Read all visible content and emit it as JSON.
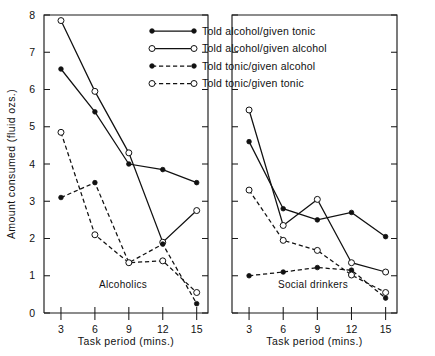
{
  "figure": {
    "width": 435,
    "height": 356,
    "background": "#ffffff",
    "ink_color": "#111111"
  },
  "chart_data": {
    "type": "line",
    "title": "",
    "xlabel": "Task period (mins.)",
    "ylabel": "Amount consumed (fluid ozs.)",
    "x": [
      3,
      6,
      9,
      12,
      15
    ],
    "xlim": [
      1.5,
      16.0
    ],
    "ylim": [
      0,
      8
    ],
    "xticks": [
      "3",
      "6",
      "9",
      "12",
      "15"
    ],
    "yticks": [
      "0",
      "1",
      "2",
      "3",
      "4",
      "5",
      "6",
      "7",
      "8"
    ],
    "grid": false,
    "legend_position": "top-center",
    "panels": [
      {
        "name": "Alcoholics",
        "label": "Alcoholics",
        "series": [
          {
            "name": "Told alcohol/given tonic",
            "marker": "filled-circle",
            "line": "solid",
            "values": [
              6.55,
              5.4,
              4.0,
              3.85,
              3.5
            ]
          },
          {
            "name": "Told alcohol/given alcohol",
            "marker": "open-circle",
            "line": "solid",
            "values": [
              7.85,
              5.95,
              4.3,
              1.9,
              2.75
            ]
          },
          {
            "name": "Told tonic/given alcohol",
            "marker": "filled-circle",
            "line": "dashed",
            "values": [
              3.1,
              3.5,
              1.35,
              1.85,
              0.25
            ]
          },
          {
            "name": "Told tonic/given tonic",
            "marker": "open-circle",
            "line": "dashed",
            "values": [
              4.85,
              2.1,
              1.35,
              1.4,
              0.55
            ]
          }
        ]
      },
      {
        "name": "Social drinkers",
        "label": "Social drinkers",
        "series": [
          {
            "name": "Told alcohol/given tonic",
            "marker": "filled-circle",
            "line": "solid",
            "values": [
              4.6,
              2.8,
              2.5,
              2.7,
              2.05
            ]
          },
          {
            "name": "Told alcohol/given alcohol",
            "marker": "open-circle",
            "line": "solid",
            "values": [
              5.45,
              2.35,
              3.05,
              1.35,
              1.1
            ]
          },
          {
            "name": "Told tonic/given alcohol",
            "marker": "filled-circle",
            "line": "dashed",
            "values": [
              1.0,
              1.1,
              1.22,
              1.15,
              0.4
            ]
          },
          {
            "name": "Told tonic/given tonic",
            "marker": "open-circle",
            "line": "dashed",
            "values": [
              3.3,
              1.95,
              1.68,
              1.02,
              0.55
            ]
          }
        ]
      }
    ],
    "legend": [
      {
        "label": "Told alcohol/given tonic",
        "marker": "filled-circle",
        "line": "solid"
      },
      {
        "label": "Told alcohol/given alcohol",
        "marker": "open-circle",
        "line": "solid"
      },
      {
        "label": "Told tonic/given alcohol",
        "marker": "filled-circle",
        "line": "dashed"
      },
      {
        "label": "Told tonic/given tonic",
        "marker": "open-circle",
        "line": "dashed"
      }
    ]
  }
}
